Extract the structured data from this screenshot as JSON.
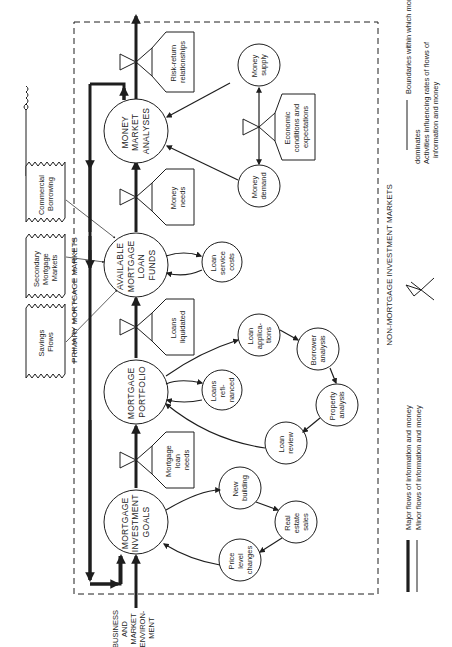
{
  "diagram": {
    "orientation": "rotated-90-ccw",
    "colors": {
      "ink": "#1e1e1e",
      "background": "#ffffff"
    },
    "region_labels": {
      "primary": "PRIMARY MORTGAGE MARKETS",
      "non_mortgage": "NON-MORTGAGE INVESTMENT MARKETS",
      "environment": [
        "BUSINESS",
        "AND",
        "MARKET",
        "ENVIRON-",
        "MENT"
      ]
    },
    "main_nodes": [
      {
        "id": "goals",
        "lines": [
          "MORTGAGE",
          "INVESTMENT",
          "GOALS"
        ]
      },
      {
        "id": "portfolio",
        "lines": [
          "MORTGAGE",
          "PORTFOLIO"
        ]
      },
      {
        "id": "funds",
        "lines": [
          "AVAILABLE",
          "MORTGAGE",
          "LOAN",
          "FUNDS"
        ]
      },
      {
        "id": "money_market",
        "lines": [
          "MONEY",
          "MARKET",
          "ANALYSES"
        ]
      }
    ],
    "rate_boxes": [
      {
        "id": "mortgage_loan_needs",
        "lines": [
          "Mortgage",
          "loan",
          "needs"
        ]
      },
      {
        "id": "loans_liquidated",
        "lines": [
          "Loans",
          "liquidated"
        ]
      },
      {
        "id": "money_needs",
        "lines": [
          "Money",
          "needs"
        ]
      },
      {
        "id": "risk_return",
        "lines": [
          "Risk-return",
          "relationships"
        ]
      },
      {
        "id": "economic_conditions",
        "lines": [
          "Economic",
          "conditions and",
          "expectations"
        ]
      }
    ],
    "sources": [
      {
        "id": "savings",
        "lines": [
          "Savings",
          "Flows"
        ]
      },
      {
        "id": "secondary",
        "lines": [
          "Secondary",
          "Mortgage",
          "Markets"
        ]
      },
      {
        "id": "commercial",
        "lines": [
          "Commercial",
          "Borrowing"
        ]
      }
    ],
    "minor_nodes": [
      {
        "id": "new_building",
        "lines": [
          "New",
          "building"
        ]
      },
      {
        "id": "real_estate_sales",
        "lines": [
          "Real",
          "estate",
          "sales"
        ]
      },
      {
        "id": "price_level",
        "lines": [
          "Price",
          "level",
          "changes"
        ]
      },
      {
        "id": "loans_refinanced",
        "lines": [
          "Loans",
          "refi-",
          "nanced"
        ]
      },
      {
        "id": "loan_applications",
        "lines": [
          "Loan",
          "applica-",
          "tions"
        ]
      },
      {
        "id": "borrower_analysis",
        "lines": [
          "Borrower",
          "analysis"
        ]
      },
      {
        "id": "property_analysis",
        "lines": [
          "Property",
          "analysis"
        ]
      },
      {
        "id": "loan_review",
        "lines": [
          "Loan",
          "review"
        ]
      },
      {
        "id": "loan_service_costs",
        "lines": [
          "Loan",
          "service",
          "costs"
        ]
      },
      {
        "id": "money_supply",
        "lines": [
          "Money",
          "supply"
        ]
      },
      {
        "id": "money_demand",
        "lines": [
          "Money",
          "demand"
        ]
      }
    ],
    "legend": {
      "major": "Major flows of information and money",
      "minor": "Minor flows of information and money",
      "boundary": [
        "Boundaries within which mortgage financing",
        "dominates"
      ],
      "activity": [
        "Activities influencing rates of flows of",
        "information and money"
      ]
    }
  }
}
